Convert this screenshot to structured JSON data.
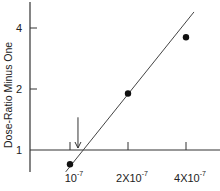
{
  "chart_data": {
    "type": "scatter",
    "title": "",
    "xlabel": "",
    "ylabel": "Dose-Ratio Minus One",
    "xscale": "log",
    "yscale": "log",
    "xlim": [
      9e-08,
      4.6e-07
    ],
    "ylim": [
      0.8,
      5.0
    ],
    "x_ticks": [
      {
        "value": 1e-07,
        "mantissa": "",
        "base": "10",
        "exponent": "-7"
      },
      {
        "value": 2e-07,
        "mantissa": "2X",
        "base": "10",
        "exponent": "-7"
      },
      {
        "value": 4e-07,
        "mantissa": "4X",
        "base": "10",
        "exponent": "-7"
      }
    ],
    "y_ticks": [
      {
        "value": 1,
        "label": "1"
      },
      {
        "value": 2,
        "label": "2"
      },
      {
        "value": 4,
        "label": "4"
      }
    ],
    "series": [
      {
        "name": "data",
        "points": [
          {
            "x": 1e-07,
            "y": 0.85
          },
          {
            "x": 2e-07,
            "y": 1.9
          },
          {
            "x": 4e-07,
            "y": 3.6
          }
        ]
      }
    ],
    "fit_line": {
      "x": [
        9.5e-08,
        4.4e-07
      ],
      "y": [
        0.78,
        4.8
      ]
    },
    "annotations": [
      {
        "type": "arrow-down",
        "x": 1.1e-07,
        "y_from": 1.45,
        "y_to": 1.0
      }
    ],
    "grid": false,
    "legend": "none"
  }
}
